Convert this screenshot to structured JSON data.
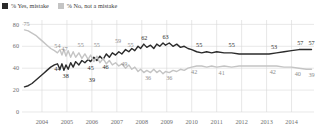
{
  "legend": {
    "items": [
      {
        "label": "% Yes, mistake",
        "color": "#2b2b2b",
        "key": "yes"
      },
      {
        "label": "% No, not a mistake",
        "color": "#c4c4c4",
        "key": "no"
      }
    ]
  },
  "axes": {
    "y_ticks": [
      "0",
      "20",
      "40",
      "60",
      "80"
    ],
    "y_values": [
      0,
      20,
      40,
      60,
      80
    ],
    "ylim": [
      0,
      84
    ],
    "x_ticks": [
      "2004",
      "2005",
      "2006",
      "2007",
      "2008",
      "2009",
      "2010",
      "2011",
      "2012",
      "2013",
      "2014"
    ],
    "x_values": [
      2004,
      2005,
      2006,
      2007,
      2008,
      2009,
      2010,
      2011,
      2012,
      2013,
      2014
    ],
    "xlim": [
      2003.2,
      2014.9
    ],
    "grid": "both"
  },
  "chart_data": {
    "type": "line",
    "title": "",
    "xlabel": "",
    "ylabel": "",
    "ylim": [
      0,
      84
    ],
    "xlim": [
      2003.2,
      2014.9
    ],
    "grid": true,
    "legend_position": "top-left",
    "categories": [
      2004,
      2005,
      2006,
      2007,
      2008,
      2009,
      2010,
      2011,
      2012,
      2013,
      2014
    ],
    "series": [
      {
        "name": "% Yes, mistake",
        "color": "#2b2b2b",
        "points": [
          [
            2003.3,
            23
          ],
          [
            2003.45,
            24
          ],
          [
            2003.6,
            26
          ],
          [
            2003.75,
            29
          ],
          [
            2003.9,
            32
          ],
          [
            2004.05,
            35
          ],
          [
            2004.2,
            38
          ],
          [
            2004.35,
            41
          ],
          [
            2004.5,
            43
          ],
          [
            2004.62,
            44
          ],
          [
            2004.72,
            39
          ],
          [
            2004.8,
            44
          ],
          [
            2004.88,
            38
          ],
          [
            2004.96,
            43
          ],
          [
            2005.05,
            39
          ],
          [
            2005.15,
            45
          ],
          [
            2005.25,
            41
          ],
          [
            2005.35,
            46
          ],
          [
            2005.48,
            43
          ],
          [
            2005.6,
            47
          ],
          [
            2005.72,
            45
          ],
          [
            2005.85,
            48
          ],
          [
            2005.95,
            46
          ],
          [
            2006.08,
            50
          ],
          [
            2006.2,
            47
          ],
          [
            2006.32,
            51
          ],
          [
            2006.45,
            48
          ],
          [
            2006.58,
            53
          ],
          [
            2006.7,
            50
          ],
          [
            2006.82,
            54
          ],
          [
            2006.95,
            52
          ],
          [
            2007.08,
            55
          ],
          [
            2007.2,
            53
          ],
          [
            2007.35,
            57
          ],
          [
            2007.48,
            55
          ],
          [
            2007.6,
            58
          ],
          [
            2007.72,
            56
          ],
          [
            2007.85,
            60
          ],
          [
            2007.95,
            58
          ],
          [
            2008.08,
            62
          ],
          [
            2008.2,
            59
          ],
          [
            2008.35,
            61
          ],
          [
            2008.48,
            58
          ],
          [
            2008.6,
            62
          ],
          [
            2008.72,
            60
          ],
          [
            2008.85,
            63
          ],
          [
            2008.95,
            61
          ],
          [
            2009.1,
            63
          ],
          [
            2009.25,
            60
          ],
          [
            2009.4,
            62
          ],
          [
            2009.55,
            59
          ],
          [
            2009.7,
            60
          ],
          [
            2009.85,
            58
          ],
          [
            2010.0,
            57
          ],
          [
            2010.2,
            55
          ],
          [
            2010.4,
            54
          ],
          [
            2010.6,
            55
          ],
          [
            2010.8,
            54
          ],
          [
            2011.0,
            55
          ],
          [
            2011.3,
            54
          ],
          [
            2011.6,
            54
          ],
          [
            2011.9,
            53
          ],
          [
            2012.2,
            53
          ],
          [
            2012.5,
            53
          ],
          [
            2012.8,
            53
          ],
          [
            2013.1,
            53
          ],
          [
            2013.4,
            54
          ],
          [
            2013.7,
            55
          ],
          [
            2014.0,
            56
          ],
          [
            2014.3,
            57
          ],
          [
            2014.6,
            57
          ],
          [
            2014.8,
            57
          ]
        ],
        "labels": [
          {
            "x": 2004.62,
            "y": 44,
            "text": "44",
            "pos": "below"
          },
          {
            "x": 2004.95,
            "y": 38,
            "text": "38",
            "pos": "below"
          },
          {
            "x": 2005.95,
            "y": 45,
            "text": "45",
            "pos": "below"
          },
          {
            "x": 2006.55,
            "y": 46,
            "text": "46",
            "pos": "below"
          },
          {
            "x": 2006.0,
            "y": 39,
            "text": "39",
            "pos": "below2"
          },
          {
            "x": 2008.1,
            "y": 62,
            "text": "62",
            "pos": "above"
          },
          {
            "x": 2008.95,
            "y": 63,
            "text": "63",
            "pos": "above"
          },
          {
            "x": 2010.3,
            "y": 55,
            "text": "55",
            "pos": "above"
          },
          {
            "x": 2011.6,
            "y": 55,
            "text": "55",
            "pos": "above"
          },
          {
            "x": 2013.3,
            "y": 53,
            "text": "53",
            "pos": "above"
          },
          {
            "x": 2014.35,
            "y": 57,
            "text": "57",
            "pos": "above"
          },
          {
            "x": 2014.8,
            "y": 57,
            "text": "57",
            "pos": "above"
          }
        ]
      },
      {
        "name": "% No, not a mistake",
        "color": "#c4c4c4",
        "points": [
          [
            2003.3,
            75
          ],
          [
            2003.45,
            74
          ],
          [
            2003.6,
            72
          ],
          [
            2003.75,
            70
          ],
          [
            2003.9,
            67
          ],
          [
            2004.05,
            64
          ],
          [
            2004.2,
            61
          ],
          [
            2004.35,
            58
          ],
          [
            2004.5,
            56
          ],
          [
            2004.62,
            54
          ],
          [
            2004.72,
            57
          ],
          [
            2004.8,
            52
          ],
          [
            2004.88,
            57
          ],
          [
            2004.96,
            51
          ],
          [
            2005.05,
            56
          ],
          [
            2005.15,
            50
          ],
          [
            2005.25,
            55
          ],
          [
            2005.35,
            50
          ],
          [
            2005.48,
            54
          ],
          [
            2005.6,
            49
          ],
          [
            2005.72,
            53
          ],
          [
            2005.85,
            48
          ],
          [
            2005.95,
            52
          ],
          [
            2006.08,
            46
          ],
          [
            2006.2,
            51
          ],
          [
            2006.32,
            45
          ],
          [
            2006.45,
            49
          ],
          [
            2006.58,
            44
          ],
          [
            2006.7,
            47
          ],
          [
            2006.82,
            43
          ],
          [
            2006.95,
            45
          ],
          [
            2007.08,
            42
          ],
          [
            2007.2,
            44
          ],
          [
            2007.35,
            40
          ],
          [
            2007.48,
            43
          ],
          [
            2007.6,
            39
          ],
          [
            2007.72,
            41
          ],
          [
            2007.85,
            37
          ],
          [
            2007.95,
            39
          ],
          [
            2008.08,
            36
          ],
          [
            2008.2,
            38
          ],
          [
            2008.35,
            36
          ],
          [
            2008.48,
            39
          ],
          [
            2008.6,
            36
          ],
          [
            2008.72,
            38
          ],
          [
            2008.85,
            35
          ],
          [
            2008.95,
            37
          ],
          [
            2009.1,
            36
          ],
          [
            2009.25,
            38
          ],
          [
            2009.4,
            37
          ],
          [
            2009.55,
            39
          ],
          [
            2009.7,
            38
          ],
          [
            2009.85,
            40
          ],
          [
            2010.0,
            41
          ],
          [
            2010.2,
            42
          ],
          [
            2010.4,
            42
          ],
          [
            2010.6,
            41
          ],
          [
            2010.8,
            42
          ],
          [
            2011.0,
            41
          ],
          [
            2011.3,
            42
          ],
          [
            2011.6,
            41
          ],
          [
            2011.9,
            42
          ],
          [
            2012.2,
            42
          ],
          [
            2012.5,
            42
          ],
          [
            2012.8,
            42
          ],
          [
            2013.1,
            42
          ],
          [
            2013.4,
            42
          ],
          [
            2013.7,
            41
          ],
          [
            2014.0,
            41
          ],
          [
            2014.3,
            40
          ],
          [
            2014.6,
            39
          ],
          [
            2014.8,
            39
          ]
        ],
        "labels": [
          {
            "x": 2003.3,
            "y": 75,
            "text": "75",
            "pos": "start"
          },
          {
            "x": 2004.62,
            "y": 54,
            "text": "54",
            "pos": "above"
          },
          {
            "x": 2004.9,
            "y": 47,
            "text": "47",
            "pos": "above2"
          },
          {
            "x": 2005.55,
            "y": 55,
            "text": "55",
            "pos": "above"
          },
          {
            "x": 2006.2,
            "y": 55,
            "text": "55",
            "pos": "above"
          },
          {
            "x": 2007.05,
            "y": 59,
            "text": "59",
            "pos": "above"
          },
          {
            "x": 2007.55,
            "y": 55,
            "text": "55",
            "pos": "above"
          },
          {
            "x": 2007.3,
            "y": 49,
            "text": "49",
            "pos": "below"
          },
          {
            "x": 2008.25,
            "y": 36,
            "text": "36",
            "pos": "below"
          },
          {
            "x": 2009.1,
            "y": 36,
            "text": "36",
            "pos": "below"
          },
          {
            "x": 2010.1,
            "y": 42,
            "text": "42",
            "pos": "below"
          },
          {
            "x": 2011.2,
            "y": 41,
            "text": "41",
            "pos": "below"
          },
          {
            "x": 2013.25,
            "y": 42,
            "text": "42",
            "pos": "below"
          },
          {
            "x": 2014.25,
            "y": 40,
            "text": "40",
            "pos": "below"
          },
          {
            "x": 2014.8,
            "y": 39,
            "text": "39",
            "pos": "below"
          }
        ]
      }
    ]
  },
  "colors": {
    "yes": "#2b2b2b",
    "no": "#c4c4c4",
    "grid": "#d8d8d8",
    "text": "#6f6f6f",
    "background": "#ffffff"
  }
}
